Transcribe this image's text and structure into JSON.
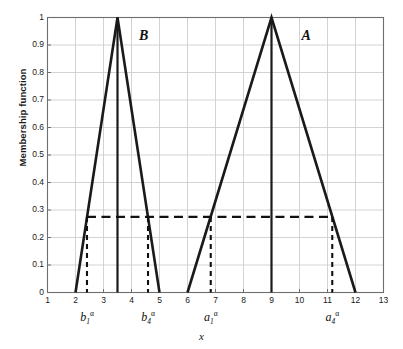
{
  "chart_data": {
    "type": "line",
    "title": "",
    "xlabel": "x",
    "ylabel": "Membership function",
    "xlim": [
      1,
      13
    ],
    "ylim": [
      0,
      1
    ],
    "grid": true,
    "legend_position": "inline-annotation",
    "xticks": [
      1,
      2,
      3,
      4,
      5,
      6,
      7,
      8,
      9,
      10,
      11,
      12,
      13
    ],
    "yticks": [
      0,
      0.1,
      0.2,
      0.3,
      0.4,
      0.5,
      0.6,
      0.7,
      0.8,
      0.9,
      1
    ],
    "ytick_labels": [
      "0",
      "0.1",
      "0.2",
      "0.3",
      "0.4",
      "0.5",
      "0.6",
      "0.7",
      "0.8",
      "0.9",
      "1"
    ],
    "xtick_labels": [
      "1",
      "2",
      "3",
      "4",
      "5",
      "6",
      "7",
      "8",
      "9",
      "10",
      "11",
      "12",
      "13"
    ],
    "alpha_level": 0.275,
    "series": [
      {
        "name": "B",
        "annotation": "B",
        "annotation_x": 4.45,
        "annotation_y": 0.93,
        "x": [
          2,
          3.5,
          5
        ],
        "y": [
          0,
          1,
          0
        ],
        "peak_x": 3.5,
        "peak_line": true
      },
      {
        "name": "A",
        "annotation": "A",
        "annotation_x": 10.25,
        "annotation_y": 0.93,
        "x": [
          6,
          9,
          12
        ],
        "y": [
          0,
          1,
          0
        ],
        "peak_x": 9,
        "peak_line": true
      }
    ],
    "alpha_cut_line": {
      "y": 0.275,
      "x_start": 2.41,
      "x_end": 11.17,
      "style": "dashed"
    },
    "alpha_cut_markers": [
      {
        "label": "b1a",
        "text_base": "b",
        "text_sub": "1",
        "text_sup": "α",
        "x": 2.41,
        "y_top": 0.275
      },
      {
        "label": "b4a",
        "text_base": "b",
        "text_sub": "4",
        "text_sup": "α",
        "x": 4.59,
        "y_top": 0.275
      },
      {
        "label": "a1a",
        "text_base": "a",
        "text_sub": "1",
        "text_sup": "α",
        "x": 6.83,
        "y_top": 0.275
      },
      {
        "label": "a4a",
        "text_base": "a",
        "text_sub": "4",
        "text_sup": "α",
        "x": 11.17,
        "y_top": 0.275
      }
    ],
    "colors": {
      "curve": "#1a1a1a",
      "grid": "#c8c8c8",
      "axis": "#6e6e6e",
      "dashed": "#111111",
      "background": "#ffffff"
    }
  }
}
